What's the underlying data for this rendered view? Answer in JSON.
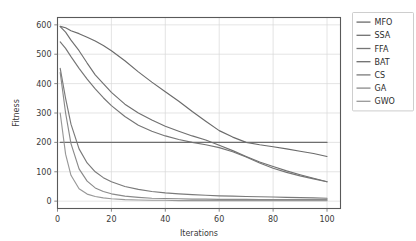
{
  "chart_data": {
    "type": "line",
    "title": "",
    "xlabel": "Iterations",
    "ylabel": "Fitness",
    "xlim": [
      0,
      105
    ],
    "ylim": [
      -25,
      625
    ],
    "xticks": [
      0,
      20,
      40,
      60,
      80,
      100
    ],
    "yticks": [
      0,
      100,
      200,
      300,
      400,
      500,
      600
    ],
    "grid": true,
    "legend_position": "right-outside",
    "legend_entries": [
      "MFO",
      "SSA",
      "FFA",
      "BAT",
      "CS",
      "GA",
      "GWO"
    ],
    "x": [
      1,
      3,
      5,
      8,
      11,
      14,
      17,
      20,
      25,
      30,
      35,
      40,
      45,
      50,
      55,
      60,
      65,
      70,
      75,
      80,
      85,
      90,
      95,
      100
    ],
    "series": [
      {
        "name": "MFO",
        "color": "#6b6b6b",
        "values": [
          595,
          590,
          580,
          570,
          558,
          545,
          530,
          512,
          478,
          440,
          405,
          372,
          340,
          305,
          272,
          240,
          218,
          200,
          192,
          185,
          178,
          170,
          162,
          152
        ]
      },
      {
        "name": "SSA",
        "color": "#707070",
        "values": [
          594,
          575,
          548,
          512,
          470,
          430,
          400,
          370,
          330,
          300,
          276,
          255,
          238,
          222,
          208,
          190,
          172,
          152,
          133,
          118,
          103,
          90,
          78,
          66
        ]
      },
      {
        "name": "FFA",
        "color": "#757575",
        "values": [
          542,
          520,
          492,
          452,
          415,
          382,
          352,
          325,
          288,
          258,
          238,
          222,
          210,
          200,
          192,
          182,
          168,
          150,
          130,
          112,
          98,
          86,
          76,
          66
        ]
      },
      {
        "name": "BAT",
        "color": "#6e6e6e",
        "values": [
          200,
          200,
          200,
          200,
          200,
          200,
          200,
          200,
          200,
          200,
          200,
          200,
          200,
          200,
          200,
          200,
          200,
          200,
          200,
          200,
          200,
          200,
          200,
          200
        ]
      },
      {
        "name": "CS",
        "color": "#7a7a7a",
        "values": [
          452,
          350,
          262,
          178,
          130,
          100,
          80,
          66,
          50,
          40,
          33,
          28,
          25,
          22,
          20,
          18,
          17,
          16,
          15,
          14,
          13,
          12,
          11,
          10
        ]
      },
      {
        "name": "GA",
        "color": "#8a8a8a",
        "values": [
          438,
          300,
          196,
          110,
          68,
          45,
          33,
          25,
          17,
          13,
          10,
          9,
          8,
          7,
          7,
          6,
          6,
          6,
          5,
          5,
          5,
          5,
          5,
          5
        ]
      },
      {
        "name": "GWO",
        "color": "#989898",
        "values": [
          300,
          160,
          88,
          42,
          24,
          16,
          11,
          8,
          5,
          4,
          3,
          3,
          2,
          2,
          2,
          2,
          2,
          2,
          2,
          2,
          2,
          2,
          2,
          2
        ]
      }
    ]
  }
}
